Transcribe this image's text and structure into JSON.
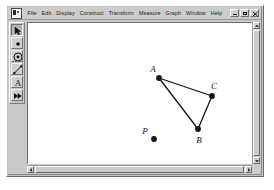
{
  "window": {
    "app_icon_name": "sketchpad-app-icon",
    "mdi_buttons": [
      {
        "name": "minimize",
        "label": "_"
      },
      {
        "name": "restore",
        "label": "❐"
      },
      {
        "name": "close",
        "label": "×"
      }
    ]
  },
  "menu": {
    "items": [
      "File",
      "Edit",
      "Display",
      "Construct",
      "Transform",
      "Measure",
      "Graph",
      "Window",
      "Help"
    ]
  },
  "toolbox": {
    "tools": [
      {
        "name": "selection-arrow-tool",
        "label": "Selection Arrow Tool",
        "selected": true
      },
      {
        "name": "point-tool",
        "label": "Point Tool",
        "selected": false
      },
      {
        "name": "compass-circle-tool",
        "label": "Compass Tool",
        "selected": false
      },
      {
        "name": "straightedge-segment-tool",
        "label": "Straightedge Tool",
        "selected": false
      },
      {
        "name": "text-tool",
        "label": "Text Tool",
        "selected": false
      },
      {
        "name": "custom-marker-tool",
        "label": "Custom Tool",
        "selected": false
      }
    ],
    "text_tool_glyph": "A"
  },
  "sketch": {
    "background": "#ffffff",
    "ink_color": "#141414",
    "points": [
      {
        "id": "A",
        "label": "A",
        "x": 150,
        "y": 70,
        "label_dx": -6,
        "label_dy": -6
      },
      {
        "id": "B",
        "label": "B",
        "x": 189,
        "y": 121,
        "label_dx": 1,
        "label_dy": 14
      },
      {
        "id": "C",
        "label": "C",
        "x": 203,
        "y": 88,
        "label_dx": 2,
        "label_dy": -7
      },
      {
        "id": "P",
        "label": "P",
        "x": 145,
        "y": 131,
        "label_dx": -9,
        "label_dy": -5
      }
    ],
    "segments": [
      {
        "name": "segment-AC",
        "from": "A",
        "to": "C"
      },
      {
        "name": "segment-AB",
        "from": "A",
        "to": "B"
      },
      {
        "name": "segment-BC",
        "from": "B",
        "to": "C"
      }
    ]
  },
  "scrollbars": {
    "vertical": {
      "up": "▲",
      "down": "▼"
    },
    "horizontal": {
      "left": "◄",
      "right": "►"
    }
  }
}
